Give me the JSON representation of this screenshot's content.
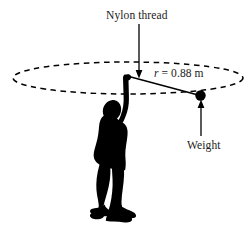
{
  "figure": {
    "type": "physics-diagram",
    "background_color": "#ffffff",
    "ink_color": "#000000",
    "width": 252,
    "height": 227
  },
  "labels": {
    "nylon_thread": "Nylon thread",
    "weight": "Weight",
    "radius_symbol": "r",
    "radius_equals": " = 0.88 m",
    "radius_full": "r = 0.88 m"
  },
  "values": {
    "radius_value": "0.88",
    "radius_unit": "m"
  },
  "elements": {
    "circle_path": "dashed-ellipse",
    "person": "person-silhouette",
    "weight_marker": "weight-dot",
    "thread": "thread-line",
    "thread_pointer": "nylon-thread-arrow",
    "weight_pointer": "weight-arrow"
  }
}
